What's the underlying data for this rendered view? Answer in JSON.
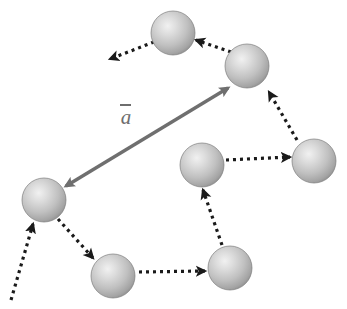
{
  "figure": {
    "type": "diagram",
    "title": "",
    "background_color": "#ffffff",
    "width": 347,
    "height": 309
  },
  "vector_label": {
    "glyph": "a",
    "overbar": true,
    "text": "ā",
    "color": "#6e6e6e",
    "position": {
      "x": 120,
      "y": 104
    }
  },
  "sphere_style": {
    "fill_light": "#e3e3e3",
    "fill_mid": "#bdbdbd",
    "fill_dark": "#8f8f8f",
    "edge": "#7d7d7d",
    "highlight": "#f0f0f0"
  },
  "arrow_styles": {
    "dotted": {
      "color": "#1a1a1a",
      "dash": "3 4",
      "width": 3.2
    },
    "vector": {
      "color": "#6f6f6f",
      "width": 3.4
    }
  },
  "spheres": [
    {
      "id": "sphere-top",
      "label": "top",
      "cx": 173,
      "cy": 33,
      "r": 22
    },
    {
      "id": "sphere-top-right",
      "label": "top-right",
      "cx": 247,
      "cy": 66,
      "r": 22
    },
    {
      "id": "sphere-right",
      "label": "right",
      "cx": 314,
      "cy": 161,
      "r": 22
    },
    {
      "id": "sphere-middle",
      "label": "middle",
      "cx": 202,
      "cy": 165,
      "r": 22
    },
    {
      "id": "sphere-left",
      "label": "left",
      "cx": 44,
      "cy": 200,
      "r": 22
    },
    {
      "id": "sphere-bottom-left",
      "label": "bottom-left",
      "cx": 113,
      "cy": 276,
      "r": 22
    },
    {
      "id": "sphere-bottom-middle",
      "label": "bottom-middle",
      "cx": 230,
      "cy": 268,
      "r": 22
    }
  ],
  "dotted_arrows": [
    {
      "id": "arrow-top-to-upperleft",
      "from": "sphere-top",
      "to": "off-canvas-upper-left",
      "x1": 154,
      "y1": 42,
      "x2": 110,
      "y2": 59
    },
    {
      "id": "arrow-topright-to-top",
      "from": "sphere-top-right",
      "to": "sphere-top",
      "x1": 231,
      "y1": 52,
      "x2": 196,
      "y2": 40
    },
    {
      "id": "arrow-right-to-topright",
      "from": "sphere-right",
      "to": "sphere-top-right",
      "x1": 297,
      "y1": 140,
      "x2": 269,
      "y2": 92
    },
    {
      "id": "arrow-middle-to-right",
      "from": "sphere-middle",
      "to": "sphere-right",
      "x1": 226,
      "y1": 160,
      "x2": 290,
      "y2": 157
    },
    {
      "id": "arrow-bottommiddle-to-middle",
      "from": "sphere-bottom-middle",
      "to": "sphere-middle",
      "x1": 222,
      "y1": 245,
      "x2": 203,
      "y2": 190
    },
    {
      "id": "arrow-bottomleft-to-bottommiddle",
      "from": "sphere-bottom-left",
      "to": "sphere-bottom-middle",
      "x1": 139,
      "y1": 272,
      "x2": 205,
      "y2": 271
    },
    {
      "id": "arrow-left-to-bottomleft",
      "from": "sphere-left",
      "to": "sphere-bottom-left",
      "x1": 58,
      "y1": 219,
      "x2": 93,
      "y2": 258
    },
    {
      "id": "arrow-offcanvas-to-left",
      "from": "off-canvas-bottom-left",
      "to": "sphere-left",
      "x1": 11,
      "y1": 300,
      "x2": 33,
      "y2": 224
    }
  ],
  "vector_arrow": {
    "id": "vector-a",
    "double_headed": true,
    "from": "sphere-left",
    "to": "sphere-top-right",
    "x1": 66,
    "y1": 186,
    "x2": 228,
    "y2": 88
  }
}
